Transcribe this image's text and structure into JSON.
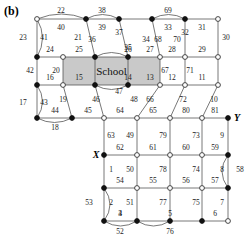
{
  "figure": {
    "panel_label": "(b)",
    "width": 246,
    "height": 241,
    "background": "#ffffff",
    "stroke_color": "#555555",
    "node_fill_color": "#111111",
    "node_open_color": "#ffffff",
    "region_fill_color": "#c9c9c9"
  },
  "chart_data": {
    "type": "diagram",
    "title": "(b)",
    "regions": [
      {
        "name": "school",
        "label": "School",
        "x": 63,
        "y": 57,
        "w": 97,
        "h": 28,
        "fill": "#c9c9c9"
      }
    ],
    "node_markers": [
      {
        "id": "n-22-left",
        "x": 37,
        "y": 19,
        "type": "open"
      },
      {
        "id": "n-top-a",
        "x": 86,
        "y": 19,
        "type": "filled"
      },
      {
        "id": "n-top-b",
        "x": 119,
        "y": 19,
        "type": "filled"
      },
      {
        "id": "n-top-c",
        "x": 152,
        "y": 19,
        "type": "filled"
      },
      {
        "id": "n-top-d",
        "x": 185,
        "y": 19,
        "type": "filled"
      },
      {
        "id": "n-top-e",
        "x": 218,
        "y": 19,
        "type": "open"
      },
      {
        "id": "n-r1-a",
        "x": 37,
        "y": 57,
        "type": "filled"
      },
      {
        "id": "n-r1-b",
        "x": 63,
        "y": 57,
        "type": "open"
      },
      {
        "id": "n-r1-c",
        "x": 95,
        "y": 57,
        "type": "filled"
      },
      {
        "id": "n-r1-d",
        "x": 128,
        "y": 57,
        "type": "filled"
      },
      {
        "id": "n-r1-e",
        "x": 160,
        "y": 57,
        "type": "open"
      },
      {
        "id": "n-r1-f",
        "x": 185,
        "y": 57,
        "type": "open"
      },
      {
        "id": "n-r1-g",
        "x": 218,
        "y": 57,
        "type": "open"
      },
      {
        "id": "n-r2-a",
        "x": 37,
        "y": 85,
        "type": "filled"
      },
      {
        "id": "n-r2-b",
        "x": 63,
        "y": 85,
        "type": "open"
      },
      {
        "id": "n-r2-c",
        "x": 95,
        "y": 85,
        "type": "filled"
      },
      {
        "id": "n-r2-d",
        "x": 128,
        "y": 85,
        "type": "filled"
      },
      {
        "id": "n-r2-e",
        "x": 160,
        "y": 85,
        "type": "open"
      },
      {
        "id": "n-r2-f",
        "x": 185,
        "y": 85,
        "type": "open"
      },
      {
        "id": "n-r2-g",
        "x": 218,
        "y": 85,
        "type": "open"
      },
      {
        "id": "n-r3-a",
        "x": 37,
        "y": 118,
        "type": "filled"
      },
      {
        "id": "n-r3-b",
        "x": 72,
        "y": 118,
        "type": "filled"
      },
      {
        "id": "n-r3-c",
        "x": 104,
        "y": 118,
        "type": "open"
      },
      {
        "id": "n-r3-d",
        "x": 137,
        "y": 118,
        "type": "open"
      },
      {
        "id": "n-r3-e",
        "x": 170,
        "y": 118,
        "type": "open"
      },
      {
        "id": "n-r3-f",
        "x": 202,
        "y": 118,
        "type": "open"
      },
      {
        "id": "n-r3-g",
        "x": 228,
        "y": 118,
        "type": "filled"
      },
      {
        "id": "n-r4-c",
        "x": 104,
        "y": 155,
        "type": "filled"
      },
      {
        "id": "n-r4-d",
        "x": 137,
        "y": 155,
        "type": "open"
      },
      {
        "id": "n-r4-e",
        "x": 170,
        "y": 155,
        "type": "open"
      },
      {
        "id": "n-r4-f",
        "x": 202,
        "y": 155,
        "type": "open"
      },
      {
        "id": "n-r4-g",
        "x": 228,
        "y": 155,
        "type": "filled"
      },
      {
        "id": "n-r5-c",
        "x": 104,
        "y": 188,
        "type": "filled"
      },
      {
        "id": "n-r5-d",
        "x": 137,
        "y": 188,
        "type": "open"
      },
      {
        "id": "n-r5-e",
        "x": 170,
        "y": 188,
        "type": "open"
      },
      {
        "id": "n-r5-f",
        "x": 202,
        "y": 188,
        "type": "open"
      },
      {
        "id": "n-r5-g",
        "x": 228,
        "y": 188,
        "type": "filled"
      },
      {
        "id": "n-r6-c",
        "x": 104,
        "y": 221,
        "type": "filled"
      },
      {
        "id": "n-r6-d",
        "x": 137,
        "y": 221,
        "type": "filled"
      },
      {
        "id": "n-r6-e",
        "x": 170,
        "y": 221,
        "type": "filled"
      },
      {
        "id": "n-r6-f",
        "x": 202,
        "y": 221,
        "type": "filled"
      },
      {
        "id": "n-r6-g",
        "x": 228,
        "y": 221,
        "type": "open"
      }
    ],
    "point_labels": [
      {
        "text": "X",
        "x": 96,
        "y": 155
      },
      {
        "text": "Y",
        "x": 237,
        "y": 118
      }
    ],
    "edge_labels": [
      {
        "text": "22",
        "x": 61,
        "y": 11
      },
      {
        "text": "38",
        "x": 102,
        "y": 11
      },
      {
        "text": "69",
        "x": 168,
        "y": 11
      },
      {
        "text": "23",
        "x": 23,
        "y": 38
      },
      {
        "text": "41",
        "x": 44,
        "y": 38
      },
      {
        "text": "40",
        "x": 61,
        "y": 28
      },
      {
        "text": "21",
        "x": 78,
        "y": 38
      },
      {
        "text": "39",
        "x": 102,
        "y": 28
      },
      {
        "text": "36",
        "x": 92,
        "y": 40
      },
      {
        "text": "37",
        "x": 119,
        "y": 33
      },
      {
        "text": "34",
        "x": 146,
        "y": 40
      },
      {
        "text": "33",
        "x": 168,
        "y": 28
      },
      {
        "text": "68",
        "x": 158,
        "y": 40
      },
      {
        "text": "32",
        "x": 185,
        "y": 33
      },
      {
        "text": "70",
        "x": 177,
        "y": 40
      },
      {
        "text": "31",
        "x": 202,
        "y": 28
      },
      {
        "text": "30",
        "x": 226,
        "y": 38
      },
      {
        "text": "35",
        "x": 128,
        "y": 48
      },
      {
        "text": "24",
        "x": 50,
        "y": 50
      },
      {
        "text": "25",
        "x": 79,
        "y": 50
      },
      {
        "text": "26",
        "x": 128,
        "y": 50
      },
      {
        "text": "27",
        "x": 150,
        "y": 50
      },
      {
        "text": "28",
        "x": 172,
        "y": 50
      },
      {
        "text": "29",
        "x": 202,
        "y": 50
      },
      {
        "text": "42",
        "x": 30,
        "y": 71
      },
      {
        "text": "20",
        "x": 56,
        "y": 71
      },
      {
        "text": "67",
        "x": 165,
        "y": 71
      },
      {
        "text": "71",
        "x": 190,
        "y": 71
      },
      {
        "text": "16",
        "x": 50,
        "y": 78
      },
      {
        "text": "15",
        "x": 79,
        "y": 78
      },
      {
        "text": "14",
        "x": 128,
        "y": 78
      },
      {
        "text": "13",
        "x": 150,
        "y": 78
      },
      {
        "text": "12",
        "x": 172,
        "y": 78
      },
      {
        "text": "11",
        "x": 202,
        "y": 78
      },
      {
        "text": "17",
        "x": 23,
        "y": 103
      },
      {
        "text": "43",
        "x": 44,
        "y": 103
      },
      {
        "text": "19",
        "x": 63,
        "y": 100
      },
      {
        "text": "46",
        "x": 96,
        "y": 100
      },
      {
        "text": "47",
        "x": 119,
        "y": 92
      },
      {
        "text": "48",
        "x": 134,
        "y": 100
      },
      {
        "text": "66",
        "x": 150,
        "y": 100
      },
      {
        "text": "72",
        "x": 183,
        "y": 100
      },
      {
        "text": "10",
        "x": 214,
        "y": 100
      },
      {
        "text": "44",
        "x": 55,
        "y": 111
      },
      {
        "text": "45",
        "x": 88,
        "y": 111
      },
      {
        "text": "64",
        "x": 120,
        "y": 111
      },
      {
        "text": "65",
        "x": 153,
        "y": 111
      },
      {
        "text": "80",
        "x": 186,
        "y": 111
      },
      {
        "text": "81",
        "x": 215,
        "y": 111
      },
      {
        "text": "18",
        "x": 55,
        "y": 128
      },
      {
        "text": "63",
        "x": 111,
        "y": 136
      },
      {
        "text": "49",
        "x": 130,
        "y": 136
      },
      {
        "text": "79",
        "x": 163,
        "y": 136
      },
      {
        "text": "73",
        "x": 196,
        "y": 136
      },
      {
        "text": "9",
        "x": 222,
        "y": 136
      },
      {
        "text": "62",
        "x": 120,
        "y": 148
      },
      {
        "text": "61",
        "x": 153,
        "y": 148
      },
      {
        "text": "60",
        "x": 186,
        "y": 148
      },
      {
        "text": "59",
        "x": 215,
        "y": 148
      },
      {
        "text": "1",
        "x": 111,
        "y": 170
      },
      {
        "text": "50",
        "x": 130,
        "y": 170
      },
      {
        "text": "78",
        "x": 163,
        "y": 170
      },
      {
        "text": "74",
        "x": 196,
        "y": 170
      },
      {
        "text": "8",
        "x": 222,
        "y": 170
      },
      {
        "text": "58",
        "x": 240,
        "y": 170
      },
      {
        "text": "54",
        "x": 120,
        "y": 181
      },
      {
        "text": "55",
        "x": 153,
        "y": 181
      },
      {
        "text": "56",
        "x": 186,
        "y": 181
      },
      {
        "text": "57",
        "x": 215,
        "y": 181
      },
      {
        "text": "53",
        "x": 89,
        "y": 203
      },
      {
        "text": "2",
        "x": 111,
        "y": 203
      },
      {
        "text": "51",
        "x": 130,
        "y": 203
      },
      {
        "text": "77",
        "x": 163,
        "y": 203
      },
      {
        "text": "75",
        "x": 196,
        "y": 203
      },
      {
        "text": "7",
        "x": 222,
        "y": 203
      },
      {
        "text": "3",
        "x": 120,
        "y": 214
      },
      {
        "text": "4",
        "x": 120,
        "y": 214
      },
      {
        "text": "5",
        "x": 170,
        "y": 214
      },
      {
        "text": "6",
        "x": 215,
        "y": 214
      },
      {
        "text": "52",
        "x": 120,
        "y": 232
      },
      {
        "text": "76",
        "x": 170,
        "y": 232
      }
    ]
  }
}
